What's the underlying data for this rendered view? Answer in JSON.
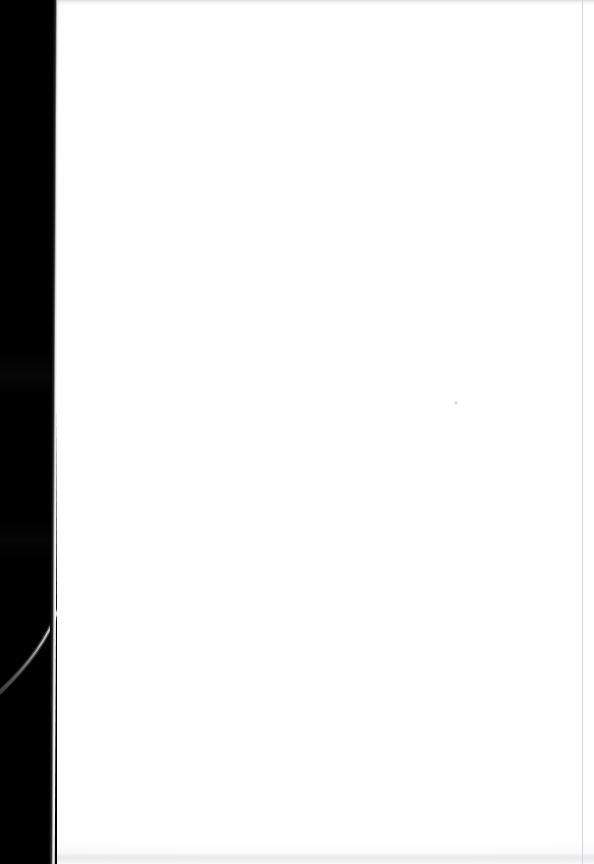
{
  "document": {
    "kind": "scanned-page",
    "page_content": "",
    "page_note": "blank page",
    "background_color": "#000000",
    "paper_color": "#ffffff",
    "edge_highlight_color": "#c8c8c8",
    "scan_band_color": "#e2e2e5",
    "rule_color": "#cdcdd1",
    "speck_color": "#c4c4cb"
  },
  "regions": {
    "backdrop_label": "dark backdrop",
    "sheet_label": "blank scanned sheet",
    "left_edge_label": "page left edge",
    "top_band_label": "top scan band",
    "bottom_band_label": "bottom scan band",
    "right_rule_label": "right margin scan line",
    "curve_label": "curved page edge highlight",
    "speck_label": "toner speck"
  },
  "geometry": {
    "width": 594,
    "height": 864,
    "sheet_left": 57,
    "right_rule_x": 582,
    "speck_x": 454,
    "speck_y": 401
  }
}
